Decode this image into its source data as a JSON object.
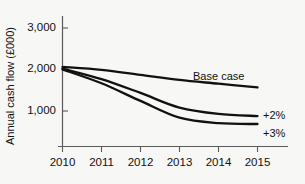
{
  "chart_data": {
    "type": "line",
    "title": "",
    "xlabel": "",
    "ylabel": "Annual cash flow (£000)",
    "x": [
      2010,
      2011,
      2012,
      2013,
      2014,
      2015
    ],
    "xtick_labels": [
      "2010",
      "2011",
      "2012",
      "2013",
      "2014",
      "2015"
    ],
    "ytick_labels": [
      "1,000",
      "2,000",
      "3,000"
    ],
    "yticks": [
      1000,
      2000,
      3000
    ],
    "ylim": [
      0,
      3200
    ],
    "xlim": [
      2010,
      2015
    ],
    "grid": false,
    "legend_position": "inline-right",
    "series": [
      {
        "name": "Base case",
        "label": "Base case",
        "values": [
          2050,
          1980,
          1860,
          1740,
          1650,
          1560
        ],
        "color": "#111111"
      },
      {
        "name": "+2%",
        "label": "+2%",
        "values": [
          2010,
          1760,
          1430,
          1080,
          930,
          880
        ],
        "color": "#111111"
      },
      {
        "name": "+3%",
        "label": "+3%",
        "values": [
          1990,
          1660,
          1240,
          840,
          710,
          690
        ],
        "color": "#111111"
      }
    ],
    "annotations": [
      {
        "text": "Base case",
        "series": "Base case",
        "x": 2013.4,
        "y": 1960
      },
      {
        "text": "+2%",
        "series": "+2%",
        "x": 2015.25,
        "y": 880
      },
      {
        "text": "+3%",
        "series": "+3%",
        "x": 2015.25,
        "y": 690
      }
    ]
  }
}
